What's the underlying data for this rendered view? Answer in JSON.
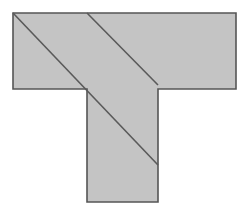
{
  "figure": {
    "canvas": {
      "width": 249,
      "height": 215,
      "background_color": "#ffffff"
    },
    "shape": {
      "name": "t-shape",
      "fill_color": "#c4c4c4",
      "outline_color": "#555555",
      "outline_width": 1.6,
      "vertices": [
        [
          13,
          13
        ],
        [
          236,
          13
        ],
        [
          236,
          89
        ],
        [
          158,
          89
        ],
        [
          158,
          202
        ],
        [
          87,
          202
        ],
        [
          87,
          89
        ],
        [
          13,
          89
        ]
      ]
    },
    "diagonals": [
      {
        "name": "upper-diagonal",
        "color": "#5a5a5a",
        "width": 1.6,
        "start": [
          87,
          13
        ],
        "end": [
          158,
          85
        ]
      },
      {
        "name": "lower-diagonal",
        "color": "#5a5a5a",
        "width": 1.6,
        "start": [
          13,
          13
        ],
        "end": [
          158,
          165
        ]
      }
    ]
  }
}
